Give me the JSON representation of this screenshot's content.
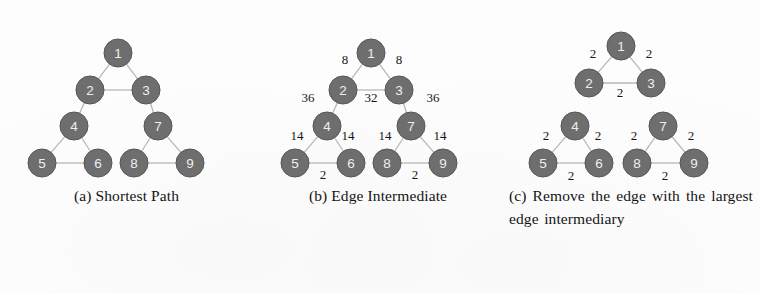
{
  "figure": {
    "background_color": "#fdfdfd",
    "node_color": "#6e6e6e",
    "node_label_color": "#efefef",
    "edge_color": "#b9b9b9",
    "weight_label_color": "#161616"
  },
  "panels": [
    {
      "id": "a",
      "caption": "(a) Shortest Path",
      "nodes": [
        {
          "id": "1",
          "label": "1",
          "x": 118,
          "y": 45
        },
        {
          "id": "2",
          "label": "2",
          "x": 90,
          "y": 82
        },
        {
          "id": "3",
          "label": "3",
          "x": 146,
          "y": 82
        },
        {
          "id": "4",
          "label": "4",
          "x": 74,
          "y": 118
        },
        {
          "id": "7",
          "label": "7",
          "x": 158,
          "y": 118
        },
        {
          "id": "5",
          "label": "5",
          "x": 42,
          "y": 155
        },
        {
          "id": "6",
          "label": "6",
          "x": 98,
          "y": 155
        },
        {
          "id": "8",
          "label": "8",
          "x": 134,
          "y": 155
        },
        {
          "id": "9",
          "label": "9",
          "x": 190,
          "y": 155
        }
      ],
      "edges": [
        {
          "from": "1",
          "to": "2",
          "weight": ""
        },
        {
          "from": "1",
          "to": "3",
          "weight": ""
        },
        {
          "from": "2",
          "to": "3",
          "weight": ""
        },
        {
          "from": "2",
          "to": "4",
          "weight": ""
        },
        {
          "from": "3",
          "to": "7",
          "weight": ""
        },
        {
          "from": "4",
          "to": "5",
          "weight": ""
        },
        {
          "from": "4",
          "to": "6",
          "weight": ""
        },
        {
          "from": "5",
          "to": "6",
          "weight": ""
        },
        {
          "from": "7",
          "to": "8",
          "weight": ""
        },
        {
          "from": "7",
          "to": "9",
          "weight": ""
        },
        {
          "from": "8",
          "to": "9",
          "weight": ""
        }
      ]
    },
    {
      "id": "b",
      "caption": "(b) Edge Intermediate",
      "nodes": [
        {
          "id": "1",
          "label": "1",
          "x": 118,
          "y": 45
        },
        {
          "id": "2",
          "label": "2",
          "x": 90,
          "y": 82
        },
        {
          "id": "3",
          "label": "3",
          "x": 146,
          "y": 82
        },
        {
          "id": "4",
          "label": "4",
          "x": 74,
          "y": 118
        },
        {
          "id": "7",
          "label": "7",
          "x": 158,
          "y": 118
        },
        {
          "id": "5",
          "label": "5",
          "x": 42,
          "y": 155
        },
        {
          "id": "6",
          "label": "6",
          "x": 98,
          "y": 155
        },
        {
          "id": "8",
          "label": "8",
          "x": 134,
          "y": 155
        },
        {
          "id": "9",
          "label": "9",
          "x": 190,
          "y": 155
        }
      ],
      "edges": [
        {
          "from": "1",
          "to": "2",
          "weight": "8",
          "lx": 92,
          "ly": 51
        },
        {
          "from": "1",
          "to": "3",
          "weight": "8",
          "lx": 146,
          "ly": 51
        },
        {
          "from": "2",
          "to": "3",
          "weight": "32",
          "lx": 118,
          "ly": 89
        },
        {
          "from": "2",
          "to": "4",
          "weight": "36",
          "lx": 55,
          "ly": 89
        },
        {
          "from": "3",
          "to": "7",
          "weight": "36",
          "lx": 180,
          "ly": 89
        },
        {
          "from": "4",
          "to": "5",
          "weight": "14",
          "lx": 44,
          "ly": 127
        },
        {
          "from": "4",
          "to": "6",
          "weight": "14",
          "lx": 95,
          "ly": 127
        },
        {
          "from": "5",
          "to": "6",
          "weight": "2",
          "lx": 70,
          "ly": 166
        },
        {
          "from": "7",
          "to": "8",
          "weight": "14",
          "lx": 132,
          "ly": 127
        },
        {
          "from": "7",
          "to": "9",
          "weight": "14",
          "lx": 187,
          "ly": 127
        },
        {
          "from": "8",
          "to": "9",
          "weight": "2",
          "lx": 162,
          "ly": 166
        }
      ]
    },
    {
      "id": "c",
      "caption": "(c) Remove the edge with the largest edge intermediary",
      "nodes": [
        {
          "id": "1",
          "label": "1",
          "x": 118,
          "y": 38
        },
        {
          "id": "2",
          "label": "2",
          "x": 86,
          "y": 75
        },
        {
          "id": "3",
          "label": "3",
          "x": 148,
          "y": 75
        },
        {
          "id": "4",
          "label": "4",
          "x": 72,
          "y": 118
        },
        {
          "id": "7",
          "label": "7",
          "x": 160,
          "y": 118
        },
        {
          "id": "5",
          "label": "5",
          "x": 40,
          "y": 155
        },
        {
          "id": "6",
          "label": "6",
          "x": 96,
          "y": 155
        },
        {
          "id": "8",
          "label": "8",
          "x": 134,
          "y": 155
        },
        {
          "id": "9",
          "label": "9",
          "x": 191,
          "y": 155
        }
      ],
      "edges": [
        {
          "from": "1",
          "to": "2",
          "weight": "2",
          "lx": 90,
          "ly": 45
        },
        {
          "from": "1",
          "to": "3",
          "weight": "2",
          "lx": 146,
          "ly": 45
        },
        {
          "from": "2",
          "to": "3",
          "weight": "2",
          "lx": 117,
          "ly": 84
        },
        {
          "from": "4",
          "to": "5",
          "weight": "2",
          "lx": 43,
          "ly": 127
        },
        {
          "from": "4",
          "to": "6",
          "weight": "2",
          "lx": 95,
          "ly": 127
        },
        {
          "from": "5",
          "to": "6",
          "weight": "2",
          "lx": 68,
          "ly": 167
        },
        {
          "from": "7",
          "to": "8",
          "weight": "2",
          "lx": 131,
          "ly": 127
        },
        {
          "from": "7",
          "to": "9",
          "weight": "2",
          "lx": 188,
          "ly": 127
        },
        {
          "from": "8",
          "to": "9",
          "weight": "2",
          "lx": 162,
          "ly": 167
        }
      ],
      "removed_edges": [
        {
          "from": "2",
          "to": "4"
        },
        {
          "from": "3",
          "to": "7"
        }
      ]
    }
  ],
  "chart_data": {
    "type": "diagram",
    "node_ids": [
      "1",
      "2",
      "3",
      "4",
      "5",
      "6",
      "7",
      "8",
      "9"
    ],
    "panel_a": {
      "caption": "(a) Shortest Path",
      "edges": [
        [
          "1",
          "2"
        ],
        [
          "1",
          "3"
        ],
        [
          "2",
          "3"
        ],
        [
          "2",
          "4"
        ],
        [
          "3",
          "7"
        ],
        [
          "4",
          "5"
        ],
        [
          "4",
          "6"
        ],
        [
          "5",
          "6"
        ],
        [
          "7",
          "8"
        ],
        [
          "7",
          "9"
        ],
        [
          "8",
          "9"
        ]
      ],
      "edge_weights": []
    },
    "panel_b": {
      "caption": "(b) Edge Intermediate",
      "edges": [
        [
          "1",
          "2"
        ],
        [
          "1",
          "3"
        ],
        [
          "2",
          "3"
        ],
        [
          "2",
          "4"
        ],
        [
          "3",
          "7"
        ],
        [
          "4",
          "5"
        ],
        [
          "4",
          "6"
        ],
        [
          "5",
          "6"
        ],
        [
          "7",
          "8"
        ],
        [
          "7",
          "9"
        ],
        [
          "8",
          "9"
        ]
      ],
      "edge_weights": [
        8,
        8,
        32,
        36,
        36,
        14,
        14,
        2,
        14,
        14,
        2
      ],
      "max_weight": 36
    },
    "panel_c": {
      "caption": "(c) Remove the edge with the largest edge intermediary",
      "edges": [
        [
          "1",
          "2"
        ],
        [
          "1",
          "3"
        ],
        [
          "2",
          "3"
        ],
        [
          "4",
          "5"
        ],
        [
          "4",
          "6"
        ],
        [
          "5",
          "6"
        ],
        [
          "7",
          "8"
        ],
        [
          "7",
          "9"
        ],
        [
          "8",
          "9"
        ]
      ],
      "edge_weights": [
        2,
        2,
        2,
        2,
        2,
        2,
        2,
        2,
        2
      ],
      "removed_edges": [
        [
          "2",
          "4"
        ],
        [
          "3",
          "7"
        ]
      ]
    }
  }
}
